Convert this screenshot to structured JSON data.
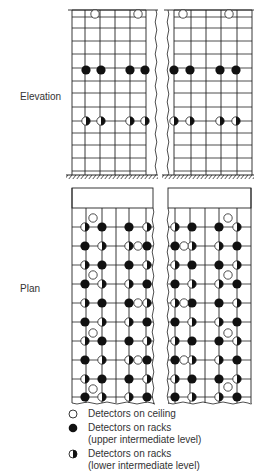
{
  "labels": {
    "elevation": "Elevation",
    "plan": "Plan"
  },
  "colors": {
    "line": "#222222",
    "filled": "#111111",
    "open_fill": "#ffffff"
  },
  "legend": [
    {
      "symbol": "open",
      "lines": [
        "Detectors on ceiling"
      ]
    },
    {
      "symbol": "filled",
      "lines": [
        "Detectors on racks",
        "(upper intermediate level)"
      ]
    },
    {
      "symbol": "half",
      "lines": [
        "Detectors on racks",
        "(lower intermediate level)"
      ]
    }
  ],
  "elevation": {
    "top": 10,
    "ground": 175,
    "row_lines": [
      10,
      17,
      28,
      41,
      54,
      68,
      81,
      93,
      107,
      121,
      133,
      145,
      158,
      171
    ],
    "left_block": {
      "x0": 72,
      "x1": 156,
      "cols": [
        72,
        85,
        100,
        115,
        130,
        146
      ]
    },
    "right_block": {
      "x0": 168,
      "x1": 252,
      "cols": [
        174,
        191,
        206,
        221,
        237,
        252
      ]
    },
    "ceiling_detectors": [
      [
        95,
        14
      ],
      [
        138,
        14
      ],
      [
        183,
        14
      ],
      [
        229,
        14
      ]
    ],
    "upper_detectors": [
      [
        86,
        70
      ],
      [
        101,
        70
      ],
      [
        130,
        70
      ],
      [
        145,
        70
      ],
      [
        174,
        70
      ],
      [
        190,
        70
      ],
      [
        220,
        70
      ],
      [
        236,
        70
      ]
    ],
    "lower_detectors": [
      [
        86,
        121
      ],
      [
        101,
        121
      ],
      [
        130,
        121
      ],
      [
        145,
        121
      ],
      [
        174,
        121
      ],
      [
        190,
        121
      ],
      [
        220,
        121
      ],
      [
        236,
        121
      ]
    ]
  },
  "plan": {
    "box_top": 188,
    "grid_top": 208,
    "bottom": 403,
    "left_block": {
      "x0": 72,
      "x1": 153,
      "cols": [
        72,
        86,
        102,
        116,
        129,
        146
      ]
    },
    "right_block": {
      "x0": 168,
      "x1": 251,
      "cols": [
        175,
        190,
        205,
        219,
        237,
        251
      ]
    },
    "rows_y": [
      227,
      246,
      265,
      284,
      303,
      322,
      341,
      360,
      379,
      397
    ],
    "left_cols_x": [
      85,
      102,
      129,
      147
    ],
    "right_cols_x": [
      175,
      192,
      219,
      237
    ],
    "row_patterns_left": [
      [
        "half",
        "filled",
        "filled",
        "half"
      ],
      [
        "filled",
        "half",
        "half",
        "filled"
      ],
      [
        "half",
        "filled",
        "filled",
        "half"
      ],
      [
        "filled",
        "half",
        "half",
        "filled"
      ],
      [
        "half",
        "filled",
        "filled",
        "half"
      ],
      [
        "filled",
        "half",
        "half",
        "filled"
      ],
      [
        "half",
        "filled",
        "filled",
        "half"
      ],
      [
        "filled",
        "half",
        "half",
        "filled"
      ],
      [
        "half",
        "filled",
        "filled",
        "half"
      ],
      [
        "filled",
        "half",
        "half",
        "filled"
      ]
    ],
    "row_patterns_right": [
      [
        "half",
        "filled",
        "filled",
        "half"
      ],
      [
        "filled",
        "half",
        "half",
        "filled"
      ],
      [
        "half",
        "filled",
        "filled",
        "half"
      ],
      [
        "filled",
        "half",
        "half",
        "filled"
      ],
      [
        "half",
        "filled",
        "filled",
        "half"
      ],
      [
        "filled",
        "half",
        "half",
        "filled"
      ],
      [
        "half",
        "filled",
        "filled",
        "half"
      ],
      [
        "filled",
        "half",
        "half",
        "filled"
      ],
      [
        "half",
        "filled",
        "filled",
        "half"
      ],
      [
        "filled",
        "half",
        "half",
        "filled"
      ]
    ],
    "ceiling_detectors": [
      [
        93,
        218
      ],
      [
        138,
        246
      ],
      [
        93,
        275
      ],
      [
        138,
        303
      ],
      [
        93,
        333
      ],
      [
        138,
        360
      ],
      [
        93,
        389
      ],
      [
        228,
        218
      ],
      [
        184,
        246
      ],
      [
        228,
        275
      ],
      [
        184,
        303
      ],
      [
        228,
        333
      ],
      [
        184,
        360
      ],
      [
        228,
        387
      ]
    ]
  }
}
